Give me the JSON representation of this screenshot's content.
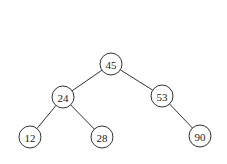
{
  "diagram": {
    "type": "binary-search-tree",
    "node_radius": 11,
    "colors": {
      "stroke": "#333333",
      "fill": "#ffffff",
      "text": "#222222"
    },
    "nodes": [
      {
        "id": "n45",
        "label": "45",
        "x": 111,
        "y": 64
      },
      {
        "id": "n24",
        "label": "24",
        "x": 63,
        "y": 97
      },
      {
        "id": "n53",
        "label": "53",
        "x": 162,
        "y": 96
      },
      {
        "id": "n12",
        "label": "12",
        "x": 30,
        "y": 137
      },
      {
        "id": "n28",
        "label": "28",
        "x": 102,
        "y": 137
      },
      {
        "id": "n90",
        "label": "90",
        "x": 200,
        "y": 136
      }
    ],
    "edges": [
      {
        "from": "n45",
        "to": "n24"
      },
      {
        "from": "n45",
        "to": "n53"
      },
      {
        "from": "n24",
        "to": "n12"
      },
      {
        "from": "n24",
        "to": "n28"
      },
      {
        "from": "n53",
        "to": "n90"
      }
    ]
  }
}
